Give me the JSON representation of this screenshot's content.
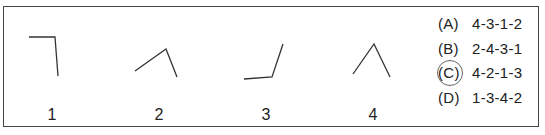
{
  "figures": [
    {
      "label": "1"
    },
    {
      "label": "2"
    },
    {
      "label": "3"
    },
    {
      "label": "4"
    }
  ],
  "options": [
    {
      "key": "(A)",
      "value": "4-3-1-2"
    },
    {
      "key": "(B)",
      "value": "2-4-3-1"
    },
    {
      "key": "(C)",
      "value": "4-2-1-3",
      "circled": true
    },
    {
      "key": "(D)",
      "value": "1-3-4-2"
    }
  ]
}
